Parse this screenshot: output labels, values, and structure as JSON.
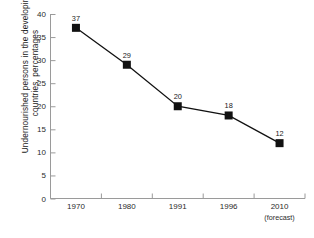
{
  "chart_data": {
    "type": "line",
    "title": "",
    "subtitle": "",
    "xlabel": "",
    "ylabel": "Undernourished persons in the developing countries, percentages",
    "ylabel_lines": [
      "Undernourished persons in the developing",
      "countries, percentages"
    ],
    "categories": [
      "1970",
      "1980",
      "1991",
      "1996",
      "2010"
    ],
    "category_sublabels": [
      "",
      "",
      "",
      "",
      "(forecast)"
    ],
    "values": [
      37,
      29,
      20,
      18,
      12
    ],
    "point_labels": [
      "37",
      "29",
      "20",
      "18",
      "12"
    ],
    "ylim": [
      0,
      40
    ],
    "ytick_values": [
      0,
      5,
      10,
      15,
      20,
      25,
      30,
      35,
      40
    ],
    "ytick_labels": [
      "0",
      "5",
      "10",
      "15",
      "20",
      "25",
      "30",
      "35",
      "40"
    ],
    "grid": false,
    "legend": false,
    "legend_position": "none",
    "marker": "square",
    "series_color": "#111111",
    "axis_color": "#9a9a9a",
    "background_color": "#ffffff",
    "text_color": "#1a1a1a"
  }
}
